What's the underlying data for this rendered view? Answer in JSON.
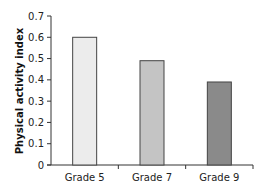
{
  "chart_data": {
    "type": "bar",
    "title": "",
    "xlabel": "",
    "ylabel": "Physical activity index",
    "categories": [
      "Grade 5",
      "Grade 7",
      "Grade 9"
    ],
    "values": [
      0.6,
      0.49,
      0.39
    ],
    "colors": [
      "#ececec",
      "#c4c4c4",
      "#8a8a8a"
    ],
    "ylim": [
      0,
      0.7
    ],
    "yticks": [
      "0",
      "0.1",
      "0.2",
      "0.3",
      "0.4",
      "0.5",
      "0.6",
      "0.7"
    ],
    "grid": false,
    "legend": "none"
  }
}
